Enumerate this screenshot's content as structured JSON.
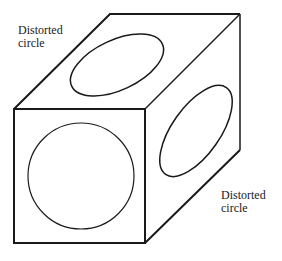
{
  "diagram": {
    "labels": {
      "top_left": [
        "Distorted",
        "circle"
      ],
      "bottom_right": [
        "Distorted",
        "circle"
      ]
    },
    "colors": {
      "stroke": "#1a1a1a",
      "background": "#ffffff"
    }
  }
}
